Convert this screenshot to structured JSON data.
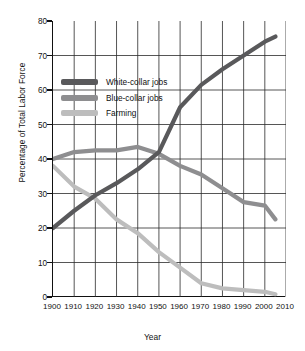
{
  "chart_data": {
    "type": "line",
    "title": "",
    "xlabel": "Year",
    "ylabel": "Percentage of Total Labor Force",
    "xlim": [
      1900,
      2010
    ],
    "ylim": [
      0,
      80
    ],
    "xticks": [
      "1900",
      "1910",
      "1920",
      "1930",
      "1940",
      "1950",
      "1960",
      "1970",
      "1980",
      "1990",
      "2000",
      "2010"
    ],
    "yticks": [
      "0",
      "10",
      "20",
      "30",
      "40",
      "50",
      "60",
      "70",
      "80"
    ],
    "grid": true,
    "legend_position": "upper-left-inside",
    "x": [
      1900,
      1910,
      1920,
      1930,
      1940,
      1950,
      1960,
      1970,
      1980,
      1990,
      2000,
      2005
    ],
    "series": [
      {
        "name": "White-collar jobs",
        "color": "#59595b",
        "values": [
          20,
          25,
          29.5,
          33,
          37,
          42,
          55,
          61.5,
          66,
          70,
          74,
          75.5
        ]
      },
      {
        "name": "Blue-collar jobs",
        "color": "#8e8e90",
        "values": [
          40,
          42,
          42.5,
          42.5,
          43.5,
          41.5,
          38,
          35.5,
          31.5,
          27.5,
          26.5,
          22.5
        ]
      },
      {
        "name": "Farming",
        "color": "#bdbdbd",
        "values": [
          38,
          32,
          28.5,
          22.5,
          18.5,
          13,
          8.5,
          4,
          2.5,
          2,
          1.5,
          0.8
        ]
      }
    ]
  },
  "legend": {
    "items": [
      {
        "label": "White-collar jobs"
      },
      {
        "label": "Blue-collar jobs"
      },
      {
        "label": "Farming"
      }
    ]
  },
  "axes": {
    "x_title": "Year",
    "y_title": "Percentage of Total Labor Force"
  }
}
